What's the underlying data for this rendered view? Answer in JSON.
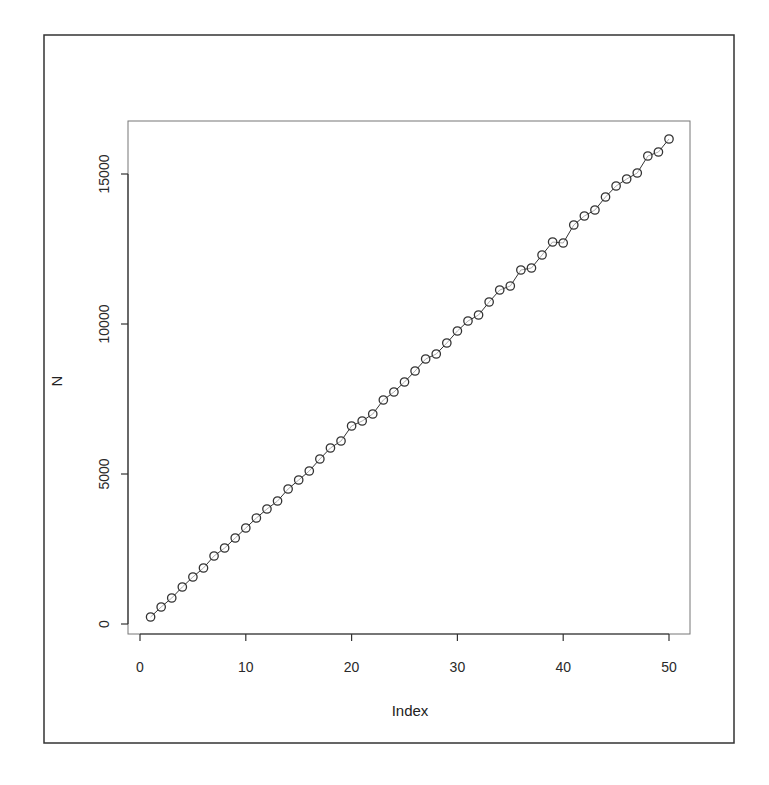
{
  "chart_data": {
    "type": "line",
    "subtype": "points-and-lines",
    "title": "",
    "xlabel": "Index",
    "ylabel": "N",
    "xlim": [
      -1,
      52
    ],
    "ylim": [
      -500,
      16800
    ],
    "x_ticks": [
      0,
      10,
      20,
      30,
      40,
      50
    ],
    "y_ticks": [
      0,
      5000,
      10000,
      15000
    ],
    "grid": false,
    "legend": null,
    "marker": "open-circle",
    "series": [
      {
        "name": "N",
        "x": [
          1,
          2,
          3,
          4,
          5,
          6,
          7,
          8,
          9,
          10,
          11,
          12,
          13,
          14,
          15,
          16,
          17,
          18,
          19,
          20,
          21,
          22,
          23,
          24,
          25,
          26,
          27,
          28,
          29,
          30,
          31,
          32,
          33,
          34,
          35,
          36,
          37,
          38,
          39,
          40,
          41,
          42,
          43,
          44,
          45,
          46,
          47,
          48,
          49,
          50
        ],
        "values": [
          233,
          567,
          867,
          1233,
          1567,
          1867,
          2267,
          2533,
          2867,
          3200,
          3533,
          3833,
          4100,
          4500,
          4800,
          5100,
          5500,
          5867,
          6100,
          6600,
          6767,
          7000,
          7467,
          7733,
          8067,
          8433,
          8833,
          9000,
          9367,
          9767,
          10100,
          10300,
          10733,
          11133,
          11267,
          11800,
          11867,
          12300,
          12733,
          12700,
          13300,
          13600,
          13800,
          14233,
          14600,
          14833,
          15033,
          15600,
          15733,
          16167
        ]
      }
    ]
  },
  "labels": {
    "xlabel": "Index",
    "ylabel": "N",
    "x_ticks": [
      "0",
      "10",
      "20",
      "30",
      "40",
      "50"
    ],
    "y_ticks": [
      "0",
      "5000",
      "10000",
      "15000"
    ]
  },
  "colors": {
    "line": "#333333",
    "marker_stroke": "#333333",
    "axis": "#333333",
    "frame": "#333333",
    "background": "#ffffff"
  }
}
